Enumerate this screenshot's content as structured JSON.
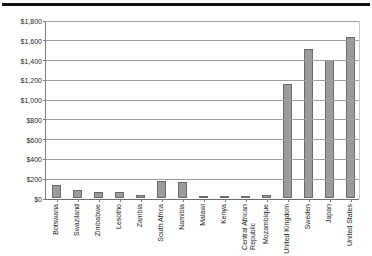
{
  "chart_data": {
    "type": "bar",
    "title": "",
    "subtitle": "",
    "xlabel": "",
    "ylabel": "",
    "ylim": [
      0,
      1800
    ],
    "ytick_step": 200,
    "grid": true,
    "legend": null,
    "value_prefix": "$",
    "categories": [
      "Botswana",
      "Swaziland",
      "Zimbabwe",
      "Lesotho",
      "Zambia",
      "South Africa",
      "Namibia",
      "Malawi",
      "Kenya",
      "Central African\nRepublic",
      "Mozambique",
      "United Kingdom",
      "Sweden",
      "Japan",
      "United States"
    ],
    "values": [
      130,
      85,
      60,
      65,
      30,
      175,
      160,
      25,
      25,
      12,
      35,
      1150,
      1505,
      1400,
      1630
    ],
    "ytick_labels": [
      "$0",
      "$200",
      "$400",
      "$600",
      "$800",
      "$1,000",
      "$1,200",
      "$1,400",
      "$1,600",
      "$1,800"
    ],
    "ytick_values": [
      0,
      200,
      400,
      600,
      800,
      1000,
      1200,
      1400,
      1600,
      1800
    ]
  },
  "style": {
    "bar_fill": "#9b9b9b",
    "bar_border": "#6a6a6a",
    "gridline_color": "#9e9e9e",
    "axis_color": "#7d7d7d",
    "text_color": "#1c1c1c",
    "rule_color": "#111111",
    "background": "#ffffff"
  }
}
